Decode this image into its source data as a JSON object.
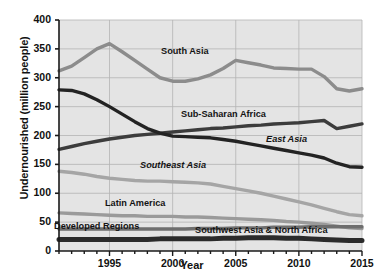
{
  "chart_data": {
    "type": "line",
    "title": "",
    "xlabel": "Year",
    "ylabel": "Undernourished (million people)",
    "xlim": [
      1991,
      2015
    ],
    "ylim": [
      0,
      400
    ],
    "yticks": [
      0,
      50,
      100,
      150,
      200,
      250,
      300,
      350,
      400
    ],
    "xticks": [
      1995,
      2000,
      2005,
      2010,
      2015
    ],
    "grid": true,
    "legend_position": "inline-labels",
    "x": [
      1991,
      1992,
      1993,
      1994,
      1995,
      1996,
      1997,
      1998,
      1999,
      2000,
      2001,
      2002,
      2003,
      2004,
      2005,
      2006,
      2007,
      2008,
      2009,
      2010,
      2011,
      2012,
      2013,
      2014,
      2015
    ],
    "series": [
      {
        "name": "South Asia",
        "color": "#8c8c8c",
        "values": [
          312,
          320,
          335,
          350,
          359,
          345,
          330,
          315,
          300,
          294,
          294,
          298,
          305,
          316,
          330,
          326,
          322,
          317,
          316,
          315,
          315,
          302,
          281,
          277,
          281
        ]
      },
      {
        "name": "Sub-Saharan Africa",
        "color": "#3c3c3c",
        "values": [
          176,
          181,
          186,
          190,
          194,
          197,
          200,
          202,
          204,
          206,
          208,
          210,
          212,
          213,
          215,
          217,
          218,
          220,
          221,
          222,
          224,
          226,
          212,
          216,
          220
        ]
      },
      {
        "name": "East Asia",
        "color": "#232323",
        "values": [
          279,
          278,
          272,
          262,
          250,
          237,
          224,
          212,
          204,
          199,
          198,
          197,
          196,
          193,
          190,
          186,
          182,
          178,
          174,
          170,
          166,
          161,
          152,
          146,
          145
        ]
      },
      {
        "name": "Southeast Asia",
        "color": "#a5a5a5",
        "values": [
          138,
          136,
          133,
          129,
          126,
          124,
          122,
          121,
          121,
          120,
          119,
          118,
          116,
          112,
          108,
          104,
          100,
          95,
          90,
          85,
          80,
          74,
          68,
          63,
          61
        ]
      },
      {
        "name": "Latin America",
        "color": "#9a9a9a",
        "values": [
          66,
          65,
          64,
          63,
          62,
          61,
          61,
          60,
          60,
          60,
          59,
          59,
          58,
          57,
          56,
          55,
          54,
          53,
          51,
          50,
          48,
          46,
          43,
          40,
          39
        ]
      },
      {
        "name": "Southwest Asia & North Africa",
        "color": "#6e6e6e",
        "values": [
          38,
          38,
          38,
          38,
          38,
          38,
          38,
          38,
          38,
          38,
          38,
          39,
          39,
          39,
          40,
          40,
          40,
          41,
          41,
          41,
          42,
          42,
          42,
          42,
          42
        ]
      },
      {
        "name": "Developed Regions",
        "color": "#2b2b2b",
        "values": [
          20,
          20,
          20,
          20,
          20,
          20,
          20,
          20,
          21,
          21,
          21,
          21,
          21,
          22,
          22,
          23,
          23,
          23,
          22,
          22,
          21,
          20,
          19,
          18,
          18
        ]
      }
    ],
    "annotations": [
      {
        "text": "South Asia",
        "x": 2001,
        "y": 345
      },
      {
        "text": "Sub-Saharan Africa",
        "x": 2004,
        "y": 235
      },
      {
        "text": "East Asia",
        "x": 2009,
        "y": 192
      },
      {
        "text": "Southeast Asia",
        "x": 2000,
        "y": 148
      },
      {
        "text": "Latin America",
        "x": 1997,
        "y": 82
      },
      {
        "text": "Developed Regions",
        "x": 1994,
        "y": 42
      },
      {
        "text": "Southwest Asia & North Africa",
        "x": 2007,
        "y": 35
      }
    ]
  },
  "styles": {
    "plot_bg": "#e4e4e4",
    "grid_color": "#b4b4b4",
    "axis_color": "#1a1a1a",
    "page_bg": "#ffffff"
  }
}
